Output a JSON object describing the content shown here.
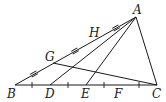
{
  "diagram": {
    "type": "geometry-triangle",
    "points": {
      "A": {
        "label": "A",
        "x": 136,
        "y": 17
      },
      "B": {
        "label": "B",
        "x": 15,
        "y": 85
      },
      "C": {
        "label": "C",
        "x": 157,
        "y": 85
      },
      "D": {
        "label": "D",
        "x": 50,
        "y": 85
      },
      "E": {
        "label": "E",
        "x": 86,
        "y": 85
      },
      "F": {
        "label": "F",
        "x": 121,
        "y": 85
      },
      "G": {
        "label": "G",
        "x": 53,
        "y": 63
      },
      "H": {
        "label": "H",
        "x": 95,
        "y": 40
      }
    },
    "segments": [
      {
        "from": "A",
        "to": "B"
      },
      {
        "from": "B",
        "to": "C"
      },
      {
        "from": "C",
        "to": "A"
      },
      {
        "from": "A",
        "to": "D"
      },
      {
        "from": "A",
        "to": "E"
      },
      {
        "from": "G",
        "to": "C"
      }
    ],
    "labels": {
      "A": "A",
      "B": "B",
      "C": "C",
      "D": "D",
      "E": "E",
      "F": "F",
      "G": "G",
      "H": "H"
    },
    "equal_marks": {
      "AB_double_ticks": 3,
      "BC_single_ticks": 4
    }
  }
}
